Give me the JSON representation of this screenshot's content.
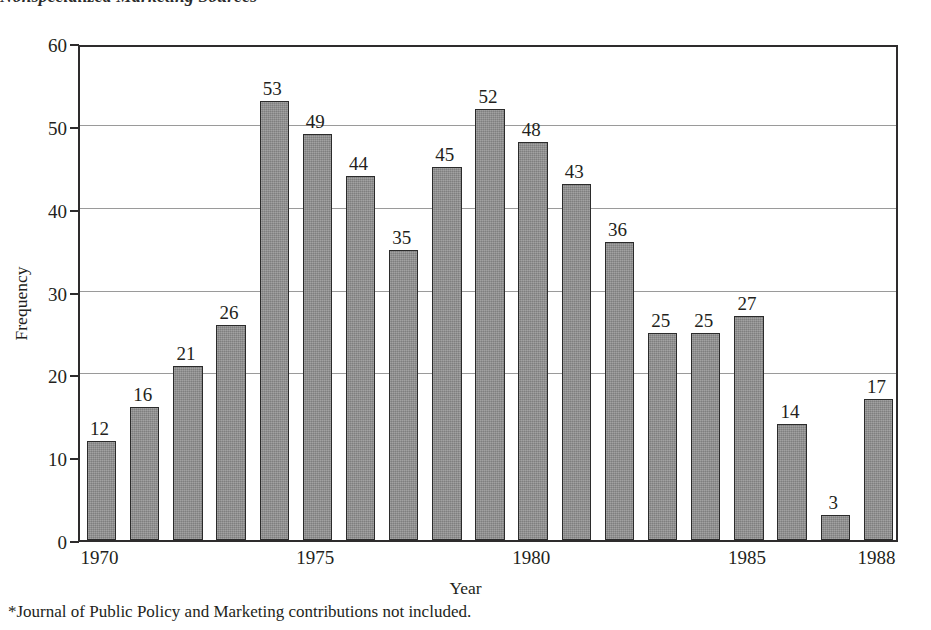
{
  "chart_title": "Nonspecialized Marketing Sources",
  "footnote": "*Journal of Public Policy and Marketing contributions not included.",
  "axes": {
    "y_title": "Frequency",
    "x_title": "Year",
    "y_ticks": [
      "0",
      "10",
      "20",
      "30",
      "40",
      "50",
      "60"
    ],
    "x_ticks": [
      "1970",
      "1975",
      "1980",
      "1985",
      "1988"
    ]
  },
  "colors": {
    "bar_fill": "#8d8d8d",
    "bar_outline": "#2b2b2b",
    "axis": "#2e2c2d",
    "gridline": "#9a9a9a",
    "text": "#231f20"
  },
  "chart_data": {
    "type": "bar",
    "title": "Nonspecialized Marketing Sources",
    "xlabel": "Year",
    "ylabel": "Frequency",
    "ylim": [
      0,
      60
    ],
    "ytick_values": [
      0,
      10,
      20,
      30,
      40,
      50,
      60
    ],
    "gridlines_at": [
      20,
      30,
      40,
      50
    ],
    "grid": true,
    "legend": null,
    "categories": [
      "1970",
      "1971",
      "1972",
      "1973",
      "1974",
      "1975",
      "1976",
      "1977",
      "1978",
      "1979",
      "1980",
      "1981",
      "1982",
      "1983",
      "1984",
      "1985",
      "1986",
      "1987",
      "1988"
    ],
    "labeled_xticks": [
      "1970",
      "1975",
      "1980",
      "1985",
      "1988"
    ],
    "values": [
      12,
      16,
      21,
      26,
      53,
      49,
      44,
      35,
      45,
      52,
      48,
      43,
      36,
      25,
      25,
      27,
      14,
      3,
      17
    ],
    "data_labels": [
      "12",
      "16",
      "21",
      "26",
      "53",
      "49",
      "44",
      "35",
      "45",
      "52",
      "48",
      "43",
      "36",
      "25",
      "25",
      "27",
      "14",
      "3",
      "17"
    ],
    "annotations": [
      "*Journal of Public Policy and Marketing contributions not included."
    ]
  }
}
